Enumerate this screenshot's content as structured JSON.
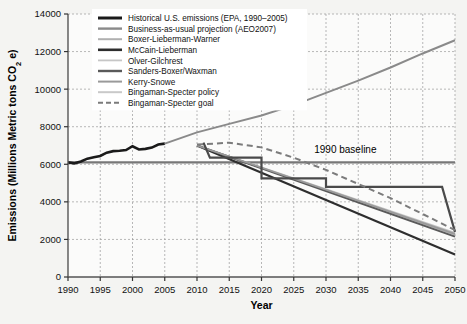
{
  "chart_data": {
    "type": "line",
    "title": "",
    "xlabel": "Year",
    "ylabel": "Emissions (Millions Metric tons CO2 e)",
    "ylabel_display": "Emissions (Millions Metric tons CO₂ e)",
    "xlim": [
      1990,
      2050
    ],
    "ylim": [
      0,
      14000
    ],
    "xticks": [
      1990,
      1995,
      2000,
      2005,
      2010,
      2015,
      2020,
      2025,
      2030,
      2035,
      2040,
      2045,
      2050
    ],
    "yticks": [
      0,
      2000,
      4000,
      6000,
      8000,
      10000,
      12000,
      14000
    ],
    "grid": true,
    "grid_style": "dashed",
    "legend_position": "top-left-inside",
    "annotations": [
      {
        "text": "1990 baseline",
        "x": 2033,
        "y": 6600
      }
    ],
    "baseline": {
      "label": "1990 baseline",
      "value": 6100,
      "x_start": 1990,
      "x_end": 2050,
      "color": "#777777"
    },
    "series": [
      {
        "name": "Historical U.S. emissions (EPA, 1990–2005)",
        "color": "#1a1a1a",
        "width": 2.6,
        "dash": "none",
        "x": [
          1990,
          1991,
          1992,
          1993,
          1994,
          1995,
          1996,
          1997,
          1998,
          1999,
          2000,
          2001,
          2002,
          2003,
          2004,
          2005
        ],
        "values": [
          6100,
          6050,
          6150,
          6300,
          6380,
          6440,
          6620,
          6700,
          6720,
          6760,
          6960,
          6790,
          6820,
          6890,
          7050,
          7100
        ]
      },
      {
        "name": "Business-as-usual projection (AEO2007)",
        "color": "#8a8a8a",
        "width": 2.0,
        "dash": "none",
        "x": [
          2005,
          2010,
          2015,
          2020,
          2025,
          2030,
          2035,
          2040,
          2045,
          2050
        ],
        "values": [
          7100,
          7700,
          8150,
          8600,
          9150,
          9800,
          10450,
          11150,
          11900,
          12600
        ]
      },
      {
        "name": "Boxer-Lieberman-Warner",
        "color": "#b0b0b0",
        "width": 1.8,
        "dash": "none",
        "x": [
          2010,
          2050
        ],
        "values": [
          7000,
          2250
        ]
      },
      {
        "name": "McCain-Lieberman",
        "color": "#2e2e2e",
        "width": 2.2,
        "dash": "none",
        "x": [
          2010,
          2050
        ],
        "values": [
          7000,
          1200
        ]
      },
      {
        "name": "Olver-Gilchrest",
        "color": "#c6c6c6",
        "width": 1.6,
        "dash": "none",
        "x": [
          2010,
          2050
        ],
        "values": [
          7000,
          2350
        ]
      },
      {
        "name": "Sanders-Boxer/Waxman",
        "color": "#5a5a5a",
        "width": 2.0,
        "dash": "none",
        "x": [
          2010,
          2050
        ],
        "values": [
          7000,
          2150
        ]
      },
      {
        "name": "Kerry-Snowe",
        "color": "#9a9a9a",
        "width": 1.8,
        "dash": "none",
        "x": [
          2010,
          2050
        ],
        "values": [
          7000,
          2300
        ]
      },
      {
        "name": "Bingaman-Specter policy",
        "color": "#4a4a4a",
        "width": 2.2,
        "dash": "none",
        "step": true,
        "x": [
          2011,
          2012,
          2020,
          2020,
          2030,
          2030,
          2048,
          2050
        ],
        "values": [
          7150,
          6350,
          6350,
          5250,
          5250,
          4800,
          4800,
          2400
        ]
      },
      {
        "name": "Bingaman-Specter goal",
        "color": "#7b7b7b",
        "width": 2.0,
        "dash": "6,4",
        "x": [
          2010,
          2015,
          2020,
          2025,
          2030,
          2035,
          2040,
          2045,
          2050
        ],
        "values": [
          7050,
          7150,
          6900,
          6350,
          5700,
          4950,
          4200,
          3350,
          2500
        ]
      }
    ]
  },
  "legend": {
    "items": [
      {
        "label": "Historical U.S. emissions (EPA, 1990–2005)",
        "color": "#1a1a1a",
        "width": 3.0,
        "dash": "none"
      },
      {
        "label": "Business-as-usual projection (AEO2007)",
        "color": "#8a8a8a",
        "width": 2.4,
        "dash": "none"
      },
      {
        "label": "Boxer-Lieberman-Warner",
        "color": "#b0b0b0",
        "width": 2.0,
        "dash": "none"
      },
      {
        "label": "McCain-Lieberman",
        "color": "#2e2e2e",
        "width": 2.6,
        "dash": "none"
      },
      {
        "label": "Olver-Gilchrest",
        "color": "#c6c6c6",
        "width": 1.8,
        "dash": "none"
      },
      {
        "label": "Sanders-Boxer/Waxman",
        "color": "#5a5a5a",
        "width": 2.4,
        "dash": "none"
      },
      {
        "label": "Kerry-Snowe",
        "color": "#9a9a9a",
        "width": 2.0,
        "dash": "none"
      },
      {
        "label": "Bingaman-Specter policy",
        "color": "#c9c9c9",
        "width": 2.0,
        "dash": "none"
      },
      {
        "label": "Bingaman-Specter goal",
        "color": "#7b7b7b",
        "width": 2.0,
        "dash": "5,3"
      }
    ]
  },
  "axes": {
    "x_title": "Year",
    "y_title": "Emissions (Millions Metric tons CO₂ e)"
  }
}
